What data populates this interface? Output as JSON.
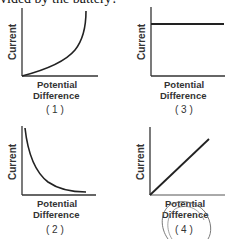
{
  "header": {
    "text": "vided by the battery?"
  },
  "graphs": [
    {
      "number": "( 1 )",
      "ylabel": "Current",
      "xlabel_line1": "Potential",
      "xlabel_line2": "Difference",
      "shape": "exponential-increase"
    },
    {
      "number": "( 2 )",
      "ylabel": "Current",
      "xlabel_line1": "Potential",
      "xlabel_line2": "Difference",
      "shape": "inverse-decrease"
    },
    {
      "number": "( 3 )",
      "ylabel": "Current",
      "xlabel_line1": "Potential",
      "xlabel_line2": "Difference",
      "shape": "constant"
    },
    {
      "number": "( 4 )",
      "ylabel": "Current",
      "xlabel_line1": "Potential",
      "xlabel_line2": "Difference",
      "shape": "linear-increase"
    }
  ],
  "annotation": {
    "circled_choice": "( 4 )"
  },
  "colors": {
    "ink": "#333333",
    "pencil": "#6a6a6a"
  }
}
